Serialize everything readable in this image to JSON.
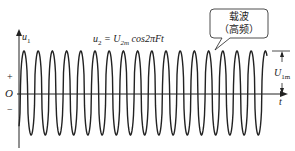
{
  "diagram": {
    "y_axis_label": "u1",
    "y_axis_label_sub": "1",
    "x_axis_label": "t",
    "origin_label": "O",
    "plus_label": "+",
    "minus_label": "−",
    "formula": {
      "lhs": "u",
      "lhs_sub": "2",
      "eq": " = U",
      "amp_sub": "2m",
      "rhs": " cos2πFt"
    },
    "amplitude_label": "U",
    "amplitude_sub": "1m",
    "callout": {
      "line1": "载波",
      "line2": "（高频）"
    },
    "wave": {
      "type": "cosine",
      "cycles_visible": 17.5,
      "period_px": 14.2,
      "axis_y_px": 94,
      "peak_y_px": 51,
      "trough_y_px": 135
    },
    "colors": {
      "stroke": "#222222",
      "background": "#ffffff"
    }
  }
}
